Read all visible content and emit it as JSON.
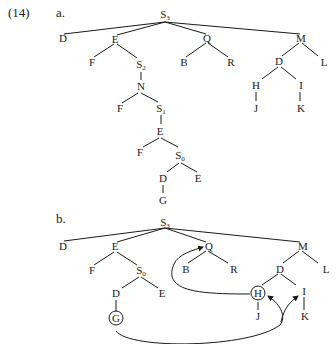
{
  "example_number": "(14)",
  "part_a": {
    "label": "a.",
    "nodes": {
      "root": {
        "text": "S",
        "sub": "3"
      },
      "D": "D",
      "E": "E",
      "F": "F",
      "S2": {
        "text": "S",
        "sub": "2"
      },
      "N": "N",
      "F2": "F",
      "S1": {
        "text": "S",
        "sub": "1"
      },
      "E2": "E",
      "F3": "F",
      "S0": {
        "text": "S",
        "sub": "0"
      },
      "D2": "D",
      "E3": "E",
      "G": "G",
      "Q": "Q",
      "B": "B",
      "R": "R",
      "M": "M",
      "D3": "D",
      "L": "L",
      "H": "H",
      "I": "I",
      "J": "J",
      "K": "K"
    }
  },
  "part_b": {
    "label": "b.",
    "nodes": {
      "root": {
        "text": "S",
        "sub": "3"
      },
      "D": "D",
      "E": "E",
      "F": "F",
      "S0": {
        "text": "S",
        "sub": "0"
      },
      "D2": "D",
      "E2": "E",
      "G": "G",
      "Q": "Q",
      "B": "B",
      "R": "R",
      "M": "M",
      "D3": "D",
      "L": "L",
      "H": "H",
      "I": "I",
      "J": "J",
      "K": "K"
    },
    "circled_nodes": [
      "G",
      "H"
    ],
    "arrows": [
      "H → Q",
      "G → H",
      "G → I"
    ]
  }
}
